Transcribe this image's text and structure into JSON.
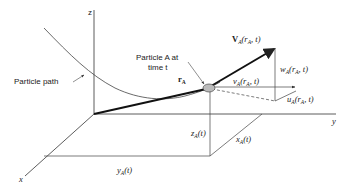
{
  "diagram": {
    "axes": {
      "x_label": "x",
      "y_label": "y",
      "z_label": "z"
    },
    "labels": {
      "particle_path": "Particle path",
      "particle_line1": "Particle A at",
      "particle_line2": "time t",
      "position_vector": "r",
      "position_vector_sub": "A",
      "velocity": "V",
      "velocity_sub": "A",
      "velocity_args": "(r",
      "velocity_args_sub": "A",
      "velocity_args_end": ", t)",
      "w_component": "w",
      "v_component": "v",
      "u_component": "u",
      "component_sub": "A",
      "component_args": "(r",
      "component_args_end": ", t)",
      "z_coord": "z",
      "y_coord": "y",
      "x_coord": "x",
      "coord_sub": "A",
      "coord_args": "(t)"
    },
    "colors": {
      "line": "#222222",
      "thin_line": "#444444",
      "particle_fill": "#bbbbbb"
    }
  }
}
